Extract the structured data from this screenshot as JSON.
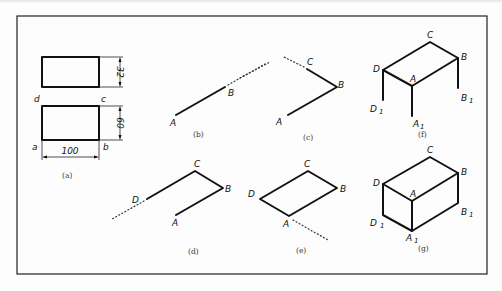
{
  "figure": {
    "frame": {
      "x": 17,
      "y": 16,
      "w": 470,
      "h": 258,
      "color": "#222222"
    },
    "panels": [
      {
        "id": "a",
        "caption": "(a)",
        "caption_pos": [
          62,
          175
        ],
        "top_rect": {
          "x": 42,
          "y": 57,
          "w": 57,
          "h": 30
        },
        "bottom_rect": {
          "x": 42,
          "y": 106,
          "w": 57,
          "h": 34
        },
        "labels": {
          "d": "d",
          "c": "c",
          "a": "a",
          "b": "b"
        },
        "dimensions": {
          "width": "100",
          "top_height": "32",
          "bottom_height": "60"
        }
      },
      {
        "id": "b",
        "caption": "(b)",
        "caption_pos": [
          203,
          135
        ],
        "points": {
          "A": [
            176,
            115
          ],
          "B": [
            225,
            87
          ]
        },
        "labels": {
          "A": "A",
          "B": "B"
        },
        "dotted_to": [
          265,
          64
        ]
      },
      {
        "id": "c",
        "caption": "(c)",
        "caption_pos": [
          313,
          139
        ],
        "points": {
          "A": [
            288,
            115
          ],
          "B": [
            337,
            87
          ],
          "C": [
            307,
            69
          ]
        },
        "labels": {
          "A": "A",
          "B": "B",
          "C": "C"
        },
        "dotted_from_B_start": [
          240,
          78
        ],
        "dotted_from_C_to": [
          284,
          57
        ]
      },
      {
        "id": "d",
        "caption": "(d)",
        "caption_pos": [
          192,
          252
        ],
        "points": {
          "A": [
            176,
            215
          ],
          "B": [
            223,
            188
          ],
          "C": [
            195,
            171
          ],
          "D": [
            147,
            199
          ]
        },
        "labels": {
          "A": "A",
          "B": "B",
          "C": "C",
          "D": "D"
        },
        "dotted_to": [
          112,
          219
        ]
      },
      {
        "id": "e",
        "caption": "(e)",
        "caption_pos": [
          300,
          251
        ],
        "points": {
          "A": [
            289,
            216
          ],
          "B": [
            337,
            188
          ],
          "C": [
            308,
            171
          ],
          "D": [
            260,
            199
          ]
        },
        "labels": {
          "A": "A",
          "B": "B",
          "C": "C",
          "D": "D"
        },
        "dotted_to": [
          328,
          240
        ]
      },
      {
        "id": "f",
        "caption": "(f)",
        "caption_pos": [
          418,
          135
        ],
        "points": {
          "A": [
            412,
            86
          ],
          "B": [
            458,
            58
          ],
          "C": [
            430,
            42
          ],
          "D": [
            383,
            70
          ],
          "A1": [
            412,
            116
          ],
          "B1": [
            458,
            88
          ],
          "D1": [
            383,
            100
          ]
        },
        "labels": {
          "A": "A",
          "B": "B",
          "C": "C",
          "D": "D",
          "A1": "A",
          "B1": "B",
          "D1": "D",
          "sub": "1"
        }
      },
      {
        "id": "g",
        "caption": "(g)",
        "caption_pos": [
          418,
          251
        ],
        "points": {
          "A": [
            412,
            201
          ],
          "B": [
            458,
            173
          ],
          "C": [
            430,
            157
          ],
          "D": [
            383,
            184
          ],
          "A1": [
            412,
            231
          ],
          "B1": [
            458,
            203
          ],
          "D1": [
            383,
            215
          ]
        },
        "labels": {
          "A": "A",
          "B": "B",
          "C": "C",
          "D": "D",
          "A1": "A",
          "B1": "B",
          "D1": "D",
          "sub": "1"
        }
      }
    ]
  }
}
